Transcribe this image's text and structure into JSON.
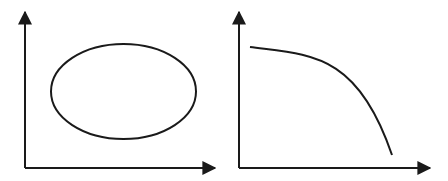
{
  "colors": {
    "background": "#ffffff",
    "stroke": "#1a1a1a"
  },
  "panels": [
    {
      "name": "left-panel",
      "shape": "ellipse",
      "axes": {
        "origin": [
          25,
          168
        ],
        "y_top": 12,
        "x_right": 215
      },
      "ellipse": {
        "cx": 123.5,
        "cy": 91.5,
        "rx": 72.5,
        "ry": 47.5
      }
    },
    {
      "name": "right-panel",
      "shape": "concave-down-curve",
      "axes": {
        "origin": [
          239,
          168
        ],
        "y_top": 12,
        "x_right": 430
      },
      "curve": {
        "start": [
          250,
          47
        ],
        "control": [
          365,
          60
        ],
        "end": [
          392,
          155
        ]
      }
    }
  ]
}
